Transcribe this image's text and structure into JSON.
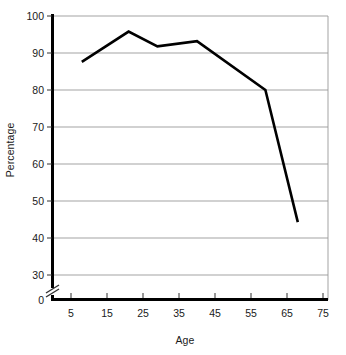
{
  "chart_data": {
    "type": "line",
    "title": "",
    "subtitle": "",
    "xlabel": "Age",
    "ylabel": "Percentage",
    "xlim": [
      0,
      77
    ],
    "ylim": [
      28,
      100
    ],
    "xticks": [
      5,
      15,
      25,
      35,
      45,
      55,
      65,
      75
    ],
    "xtick_labels": [
      "5",
      "15",
      "25",
      "35",
      "45",
      "55",
      "65",
      "75"
    ],
    "yticks": [
      0,
      30,
      40,
      50,
      60,
      70,
      80,
      90,
      100
    ],
    "ytick_labels": [
      "0",
      "30",
      "40",
      "50",
      "60",
      "70",
      "80",
      "90",
      "100"
    ],
    "grid": "horizontal",
    "axis_break": true,
    "axis_break_axis": "y",
    "legend": "none",
    "series": [
      {
        "name": "Percentage",
        "color": "#000000",
        "line_width": 2.6,
        "x": [
          8,
          21,
          29,
          40,
          59,
          68
        ],
        "values": [
          87.6,
          95.8,
          91.8,
          93.2,
          80.0,
          44.3
        ]
      }
    ],
    "annotations": []
  },
  "axes": {
    "y_axis_name": "Percentage",
    "x_axis_name": "Age",
    "break_symbol": "//"
  }
}
